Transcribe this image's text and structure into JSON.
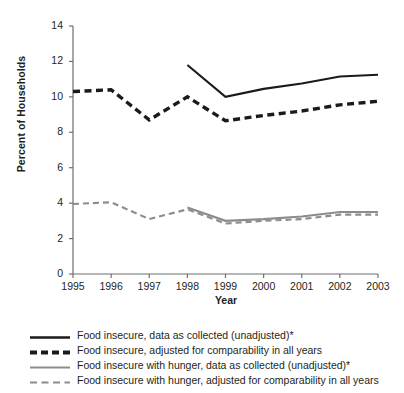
{
  "chart_data": {
    "type": "line",
    "title": "",
    "xlabel": "Year",
    "ylabel": "Percent of Households",
    "x": [
      1995,
      1996,
      1997,
      1998,
      1999,
      2000,
      2001,
      2002,
      2003
    ],
    "xlim": [
      1995,
      2003
    ],
    "ylim": [
      0,
      14
    ],
    "yticks": [
      0,
      2,
      4,
      6,
      8,
      10,
      12,
      14
    ],
    "xticks": [
      "1995",
      "1996",
      "1997",
      "1998",
      "1999",
      "2000",
      "2001",
      "2002",
      "2003"
    ],
    "grid": false,
    "legend_position": "below-plot",
    "series": [
      {
        "name": "Food insecure, data as collected (unadjusted)*",
        "color": "#1a1a1a",
        "style": "solid",
        "width": 2.1,
        "x": [
          1998,
          1999,
          2000,
          2001,
          2002,
          2003
        ],
        "values": [
          11.8,
          10.0,
          10.45,
          10.75,
          11.15,
          11.25
        ]
      },
      {
        "name": "Food insecure, adjusted for comparability in all years",
        "color": "#1a1a1a",
        "style": "dashed",
        "width": 3.4,
        "x": [
          1995,
          1996,
          1997,
          1998,
          1999,
          2000,
          2001,
          2002,
          2003
        ],
        "values": [
          10.3,
          10.4,
          8.7,
          10.0,
          8.65,
          8.95,
          9.2,
          9.55,
          9.75
        ]
      },
      {
        "name": "Food insecure with hunger, data as collected (unadjusted)*",
        "color": "#8c8c8c",
        "style": "solid",
        "width": 2.1,
        "x": [
          1998,
          1999,
          2000,
          2001,
          2002,
          2003
        ],
        "values": [
          3.75,
          3.0,
          3.1,
          3.25,
          3.5,
          3.5
        ]
      },
      {
        "name": "Food insecure with hunger, adjusted for comparability in all years",
        "color": "#8c8c8c",
        "style": "dashed",
        "width": 2.1,
        "x": [
          1995,
          1996,
          1997,
          1998,
          1999,
          2000,
          2001,
          2002,
          2003
        ],
        "values": [
          3.95,
          4.05,
          3.1,
          3.65,
          2.85,
          3.0,
          3.1,
          3.35,
          3.35
        ]
      }
    ]
  },
  "axes": {
    "y_title": "Percent of Households",
    "x_title": "Year",
    "y_tick_labels": [
      "14",
      "12",
      "10",
      "8",
      "6",
      "4",
      "2",
      "0"
    ],
    "x_tick_labels": [
      "1995",
      "1996",
      "1997",
      "1998",
      "1999",
      "2000",
      "2001",
      "2002",
      "2003"
    ],
    "axis_color": "#6e6e6e"
  },
  "legend": {
    "items": [
      {
        "label": "Food insecure, data as collected (unadjusted)*",
        "color": "#1a1a1a",
        "style": "solid",
        "thickness": "thick"
      },
      {
        "label": "Food insecure, adjusted for comparability in all years",
        "color": "#1a1a1a",
        "style": "dashed",
        "thickness": "thick"
      },
      {
        "label": "Food insecure with hunger, data as collected (unadjusted)*",
        "color": "#8c8c8c",
        "style": "solid",
        "thickness": "thin"
      },
      {
        "label": "Food insecure with hunger, adjusted for comparability in all years",
        "color": "#8c8c8c",
        "style": "dashed",
        "thickness": "thin"
      }
    ]
  },
  "colors": {
    "series_primary": "#1a1a1a",
    "series_secondary": "#8c8c8c",
    "axis": "#6e6e6e",
    "text": "#231f20",
    "background": "#ffffff"
  }
}
